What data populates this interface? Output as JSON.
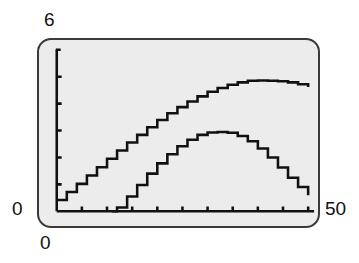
{
  "frame": {
    "border_color": "#3a3a3a",
    "background_color": "#ececec",
    "page_background": "#ffffff"
  },
  "labels": {
    "y_max": "6",
    "y_zero": "0",
    "x_zero": "0",
    "x_max": "50"
  },
  "chart_data": {
    "type": "line",
    "title": "",
    "xlabel": "",
    "ylabel": "",
    "xlim": [
      0,
      50
    ],
    "ylim": [
      0,
      6
    ],
    "grid": false,
    "legend": "none",
    "axis_color": "#111111",
    "line_color": "#111111",
    "x_tick_interval": 5,
    "y_tick_interval": 1,
    "x_ticks": [
      0,
      5,
      10,
      15,
      20,
      25,
      30,
      35,
      40,
      45,
      50
    ],
    "y_ticks": [
      0,
      1,
      2,
      3,
      4,
      5,
      6
    ],
    "x_tick_labels": [
      "0",
      "",
      "",
      "",
      "",
      "",
      "",
      "",
      "",
      "",
      "50"
    ],
    "y_tick_labels": [
      "0",
      "",
      "",
      "",
      "",
      "",
      "6"
    ],
    "series": [
      {
        "name": "upper-curve",
        "x": [
          0,
          2,
          4,
          6,
          8,
          10,
          12,
          14,
          16,
          18,
          20,
          22,
          24,
          26,
          28,
          30,
          32,
          34,
          36,
          38,
          40,
          42,
          44,
          46,
          48,
          50
        ],
        "values": [
          0.42,
          0.72,
          1.02,
          1.33,
          1.64,
          1.95,
          2.26,
          2.56,
          2.84,
          3.12,
          3.39,
          3.64,
          3.87,
          4.08,
          4.27,
          4.44,
          4.58,
          4.7,
          4.79,
          4.85,
          4.86,
          4.85,
          4.83,
          4.79,
          4.72,
          4.62
        ]
      },
      {
        "name": "lower-curve",
        "x": [
          11,
          12,
          14,
          16,
          18,
          20,
          22,
          24,
          26,
          28,
          30,
          32,
          34,
          36,
          38,
          40,
          42,
          44,
          46,
          48,
          50
        ],
        "values": [
          0.0,
          0.14,
          0.55,
          0.98,
          1.4,
          1.78,
          2.12,
          2.42,
          2.66,
          2.84,
          2.93,
          2.95,
          2.92,
          2.8,
          2.6,
          2.33,
          2.0,
          1.63,
          1.25,
          0.9,
          0.6
        ]
      }
    ]
  }
}
